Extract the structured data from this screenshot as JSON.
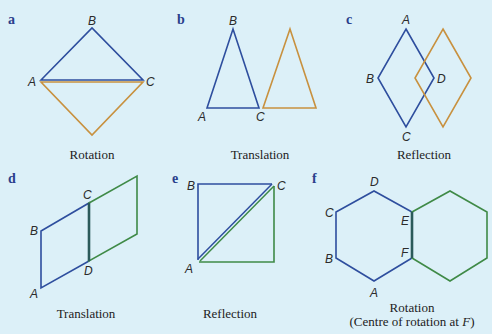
{
  "colors": {
    "background": "#dcf0f8",
    "original_shape": "#2e4e9e",
    "image_orange": "#c8913f",
    "image_green": "#3f8a47",
    "panel_letter": "#2a3f8c"
  },
  "panels": [
    {
      "letter": "a",
      "caption": "Rotation",
      "vertices": [
        "A",
        "B",
        "C"
      ]
    },
    {
      "letter": "b",
      "caption": "Translation",
      "vertices": [
        "A",
        "B",
        "C"
      ]
    },
    {
      "letter": "c",
      "caption": "Reflection",
      "vertices": [
        "A",
        "B",
        "C",
        "D"
      ]
    },
    {
      "letter": "d",
      "caption": "Translation",
      "vertices": [
        "A",
        "B",
        "C",
        "D"
      ]
    },
    {
      "letter": "e",
      "caption": "Reflection",
      "vertices": [
        "A",
        "B",
        "C"
      ]
    },
    {
      "letter": "f",
      "caption": "Rotation",
      "caption_line2_prefix": "(Centre of rotation at ",
      "caption_line2_var": "F",
      "caption_line2_suffix": ")",
      "vertices": [
        "A",
        "B",
        "C",
        "D",
        "E",
        "F"
      ]
    }
  ]
}
